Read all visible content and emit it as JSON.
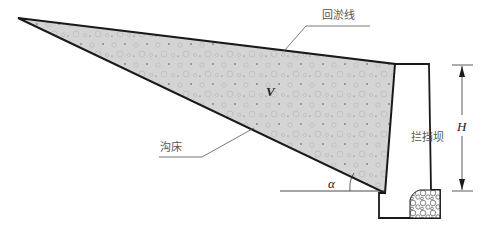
{
  "diagram": {
    "type": "check-dam siltation cross-section",
    "labels": {
      "siltation_line": "回淤线",
      "gully_bed": "沟床",
      "check_dam": "拦挡坝",
      "volume": "V",
      "height": "H",
      "angle": "α"
    },
    "colors": {
      "sediment_fill": "#d4d4d4",
      "outline": "#1a1a1a",
      "leader": "#555555",
      "texture": "#a8a8a8"
    }
  }
}
